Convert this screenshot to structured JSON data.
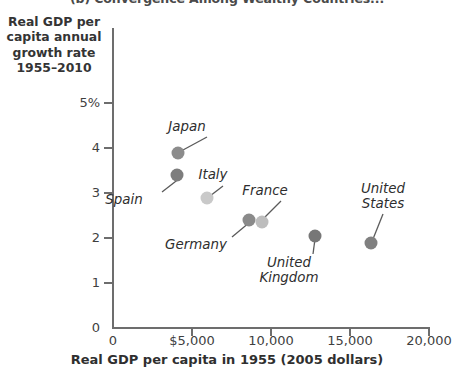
{
  "chart_data": {
    "type": "scatter",
    "title": "(b) Convergence Among Wealthy Countries...",
    "xlabel": "Real GDP per capita in 1955 (2005 dollars)",
    "ylabel": "Real GDP per capita annual growth rate 1955–2010",
    "xlim": [
      0,
      20000
    ],
    "ylim": [
      0,
      5
    ],
    "grid": false,
    "legend": "none",
    "xticks": [
      {
        "value": 0,
        "label": "0"
      },
      {
        "value": 5000,
        "label": "$5,000"
      },
      {
        "value": 10000,
        "label": "10,000"
      },
      {
        "value": 15000,
        "label": "15,000"
      },
      {
        "value": 20000,
        "label": "20,000"
      }
    ],
    "yticks": [
      {
        "value": 0,
        "label": "0"
      },
      {
        "value": 1,
        "label": "1"
      },
      {
        "value": 2,
        "label": "2"
      },
      {
        "value": 3,
        "label": "3"
      },
      {
        "value": 4,
        "label": "4"
      },
      {
        "value": 5,
        "label": "5%"
      }
    ],
    "points": [
      {
        "name": "Japan",
        "x": 4100,
        "y": 3.9,
        "color": "#8c8c8c"
      },
      {
        "name": "Spain",
        "x": 4050,
        "y": 3.4,
        "color": "#7d7d7d"
      },
      {
        "name": "Italy",
        "x": 5950,
        "y": 2.9,
        "color": "#c9c9c9"
      },
      {
        "name": "Germany",
        "x": 8600,
        "y": 2.4,
        "color": "#8a8a8a"
      },
      {
        "name": "France",
        "x": 9400,
        "y": 2.35,
        "color": "#bdbdbd"
      },
      {
        "name": "United Kingdom",
        "x": 12800,
        "y": 2.05,
        "color": "#777777"
      },
      {
        "name": "United States",
        "x": 16300,
        "y": 1.9,
        "color": "#808080"
      }
    ],
    "annotations": [
      {
        "text": "Japan",
        "label_x": 187,
        "label_y": 120,
        "leader_from": [
          207,
          137
        ],
        "leader_to": [
          183,
          150
        ]
      },
      {
        "text": "Spain",
        "label_x": 124,
        "label_y": 193,
        "leader_from": [
          162,
          192
        ],
        "leader_to": [
          180,
          178
        ]
      },
      {
        "text": "Italy",
        "label_x": 213,
        "label_y": 168,
        "leader_from": [
          223,
          186
        ],
        "leader_to": [
          210,
          196
        ]
      },
      {
        "text": "Germany",
        "label_x": 196,
        "label_y": 238,
        "leader_from": [
          232,
          237
        ],
        "leader_to": [
          250,
          222
        ]
      },
      {
        "text": "France",
        "label_x": 265,
        "label_y": 184,
        "leader_from": [
          281,
          201
        ],
        "leader_to": [
          265,
          217
        ]
      },
      {
        "text": "United\nKingdom",
        "label_x": 289,
        "label_y": 256,
        "leader_from": [
          313,
          254
        ],
        "leader_to": [
          315,
          239
        ]
      },
      {
        "text": "United\nStates",
        "label_x": 383,
        "label_y": 182,
        "leader_from": [
          383,
          214
        ],
        "leader_to": [
          373,
          239
        ]
      }
    ]
  },
  "axis_colors": {
    "axis": "#6d6d6d",
    "text": "#3a3a3a"
  }
}
